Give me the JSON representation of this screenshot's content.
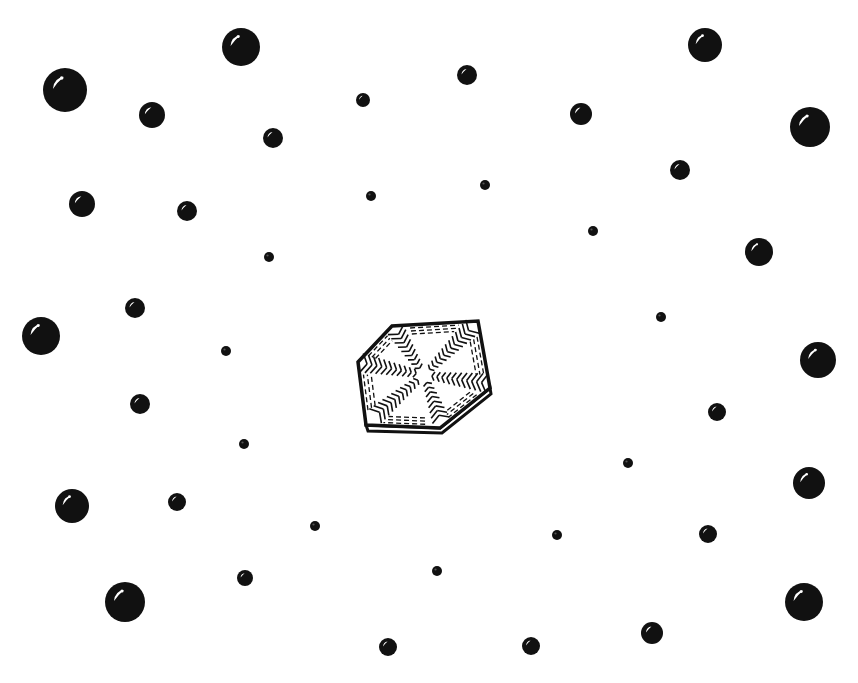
{
  "illustration": {
    "subject": "hexagonal ice crystal plate surrounded by water droplets",
    "style": "pen-and-ink",
    "background_color": "#ffffff",
    "ink_color": "#111111",
    "highlight_color": "#ffffff",
    "crystal": {
      "outline": [
        [
          358,
          362
        ],
        [
          392,
          326
        ],
        [
          478,
          321
        ],
        [
          490,
          388
        ],
        [
          440,
          428
        ],
        [
          366,
          425
        ]
      ],
      "bottom_edge": [
        [
          366,
          425
        ],
        [
          440,
          428
        ],
        [
          490,
          388
        ],
        [
          491,
          394
        ],
        [
          442,
          433
        ],
        [
          368,
          431
        ]
      ]
    },
    "droplets": [
      {
        "x": 65,
        "y": 90,
        "r": 22
      },
      {
        "x": 241,
        "y": 47,
        "r": 19
      },
      {
        "x": 705,
        "y": 45,
        "r": 17
      },
      {
        "x": 810,
        "y": 127,
        "r": 20
      },
      {
        "x": 759,
        "y": 252,
        "r": 14
      },
      {
        "x": 41,
        "y": 336,
        "r": 19
      },
      {
        "x": 818,
        "y": 360,
        "r": 18
      },
      {
        "x": 72,
        "y": 506,
        "r": 17
      },
      {
        "x": 809,
        "y": 483,
        "r": 16
      },
      {
        "x": 125,
        "y": 602,
        "r": 20
      },
      {
        "x": 804,
        "y": 602,
        "r": 19
      },
      {
        "x": 152,
        "y": 115,
        "r": 13
      },
      {
        "x": 273,
        "y": 138,
        "r": 10
      },
      {
        "x": 467,
        "y": 75,
        "r": 10
      },
      {
        "x": 581,
        "y": 114,
        "r": 11
      },
      {
        "x": 680,
        "y": 170,
        "r": 10
      },
      {
        "x": 82,
        "y": 204,
        "r": 13
      },
      {
        "x": 187,
        "y": 211,
        "r": 10
      },
      {
        "x": 135,
        "y": 308,
        "r": 10
      },
      {
        "x": 140,
        "y": 404,
        "r": 10
      },
      {
        "x": 717,
        "y": 412,
        "r": 9
      },
      {
        "x": 177,
        "y": 502,
        "r": 9
      },
      {
        "x": 708,
        "y": 534,
        "r": 9
      },
      {
        "x": 245,
        "y": 578,
        "r": 8
      },
      {
        "x": 388,
        "y": 647,
        "r": 9
      },
      {
        "x": 531,
        "y": 646,
        "r": 9
      },
      {
        "x": 652,
        "y": 633,
        "r": 11
      },
      {
        "x": 363,
        "y": 100,
        "r": 7
      },
      {
        "x": 371,
        "y": 196,
        "r": 5
      },
      {
        "x": 485,
        "y": 185,
        "r": 5
      },
      {
        "x": 269,
        "y": 257,
        "r": 5
      },
      {
        "x": 593,
        "y": 231,
        "r": 5
      },
      {
        "x": 661,
        "y": 317,
        "r": 5
      },
      {
        "x": 226,
        "y": 351,
        "r": 5
      },
      {
        "x": 244,
        "y": 444,
        "r": 5
      },
      {
        "x": 628,
        "y": 463,
        "r": 5
      },
      {
        "x": 315,
        "y": 526,
        "r": 5
      },
      {
        "x": 557,
        "y": 535,
        "r": 5
      },
      {
        "x": 437,
        "y": 571,
        "r": 5
      }
    ]
  }
}
